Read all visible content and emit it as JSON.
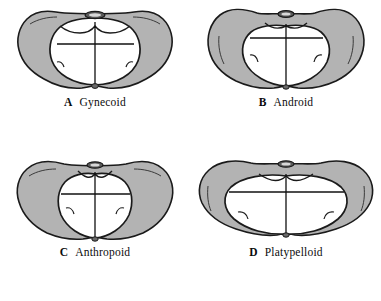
{
  "figure": {
    "background_color": "#ffffff",
    "bone_fill_color": "#b3b3b3",
    "cavity_fill_color": "#ffffff",
    "outline_color": "#1a1a1a",
    "promontory_color": "#4d4d4d"
  },
  "panels": [
    {
      "id": "a",
      "letter": "A",
      "label": "Gynecoid",
      "inlet_shape": "rounded-oval",
      "inlet_description": "Rounded, slightly transverse oval inlet with wide forepelvis",
      "diameters": {
        "transverse": "wide",
        "anteroposterior": "slightly-shorter"
      }
    },
    {
      "id": "b",
      "letter": "B",
      "label": "Android",
      "inlet_shape": "heart",
      "inlet_description": "Heart-shaped inlet with narrow, angular forepelvis",
      "diameters": {
        "transverse": "posterior-wide",
        "anteroposterior": "long"
      }
    },
    {
      "id": "c",
      "letter": "C",
      "label": "Anthropoid",
      "inlet_shape": "long-oval",
      "inlet_description": "Elongated anteroposterior oval inlet, narrow transverse",
      "diameters": {
        "transverse": "narrow",
        "anteroposterior": "longest"
      }
    },
    {
      "id": "d",
      "letter": "D",
      "label": "Platypelloid",
      "inlet_shape": "flat-oval",
      "inlet_description": "Wide flattened transverse oval inlet, short anteroposterior",
      "diameters": {
        "transverse": "widest",
        "anteroposterior": "shortest"
      }
    }
  ]
}
